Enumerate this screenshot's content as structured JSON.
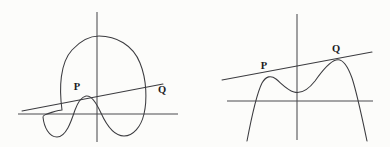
{
  "figure": {
    "background_color": "#fcfcfa",
    "stroke_color": "#3b3b3f",
    "axis_color": "#4a4a4e",
    "label_color": "#1b1b1e",
    "panels": [
      {
        "id": "left-panel",
        "name": "closed-oval-curve-panel",
        "curve_type": "closed-loop",
        "description": "Closed oval curve with a domed top and a wavy W-shaped bottom, crossed by a rising secant line",
        "axes": {
          "x_axis_y": 114,
          "x_axis_from_x": 18,
          "x_axis_to_x": 178,
          "y_axis_x": 97,
          "y_axis_from_y": 12,
          "y_axis_to_y": 142
        },
        "secant": {
          "x1": 22,
          "y1": 111,
          "x2": 163,
          "y2": 84
        },
        "points": [
          {
            "label": "P",
            "label_x": 77,
            "label_y": 90,
            "point_x": 79,
            "point_y": 100
          },
          {
            "label": "Q",
            "label_x": 160,
            "label_y": 92,
            "point_x": 152,
            "point_y": 86
          }
        ]
      },
      {
        "id": "right-panel",
        "name": "open-quartic-curve-panel",
        "curve_type": "quartic-two-humps",
        "description": "Downward-opening quartic curve with two humps and a central dip, crossed by a rising secant line tangent near both humps",
        "axes": {
          "x_axis_y": 101,
          "x_axis_from_x": 227,
          "x_axis_to_x": 373,
          "y_axis_x": 297,
          "y_axis_from_y": 14,
          "y_axis_to_y": 140
        },
        "secant": {
          "x1": 222,
          "y1": 80,
          "x2": 372,
          "y2": 52
        },
        "points": [
          {
            "label": "P",
            "label_x": 264,
            "label_y": 67,
            "point_x": 268,
            "point_y": 77
          },
          {
            "label": "Q",
            "label_x": 334,
            "label_y": 50,
            "point_x": 338,
            "point_y": 60
          }
        ]
      }
    ]
  }
}
